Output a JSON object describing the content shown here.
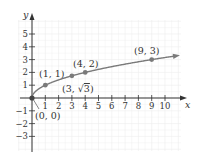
{
  "chart_data": {
    "type": "line",
    "title": "",
    "function": "y = sqrt(x)",
    "xlabel": "x",
    "ylabel": "y",
    "xlim": [
      -0.5,
      11.5
    ],
    "ylim": [
      -4,
      6.3
    ],
    "grid": true,
    "x_ticks": [
      1,
      2,
      3,
      4,
      5,
      6,
      7,
      8,
      9,
      10
    ],
    "y_ticks": [
      -3,
      -2,
      -1,
      1,
      2,
      3,
      4,
      5
    ],
    "x_tick_labels": [
      "1",
      "2",
      "3",
      "4",
      "5",
      "6",
      "7",
      "8",
      "9",
      "10"
    ],
    "y_tick_labels": [
      "−3",
      "−2",
      "−1",
      "1",
      "2",
      "3",
      "4",
      "5"
    ],
    "series": [
      {
        "name": "sqrt(x)",
        "x": [
          0,
          1,
          3,
          4,
          9,
          11
        ],
        "y": [
          0,
          1,
          1.732,
          2,
          3,
          3.317
        ],
        "end_arrow": true
      }
    ],
    "points": [
      {
        "x": 0,
        "y": 0,
        "label": "(0, 0)"
      },
      {
        "x": 1,
        "y": 1,
        "label": "(1, 1)"
      },
      {
        "x": 3,
        "y": 1.732,
        "label": "(3, √3)"
      },
      {
        "x": 4,
        "y": 2,
        "label": "(4, 2)"
      },
      {
        "x": 9,
        "y": 3,
        "label": "(9, 3)"
      }
    ]
  },
  "colors": {
    "axis": "#333333",
    "curve": "#7a7a7a",
    "point": "#7a7a7a",
    "grid": "#ececec",
    "text": "#333333"
  },
  "labels": {
    "x_axis": "x",
    "y_axis": "y",
    "p0": "(0, 0)",
    "p1": "(1, 1)",
    "p3_prefix": "(3, ",
    "p3_sqrt": "√",
    "p3_radicand": "3",
    "p3_suffix": ")",
    "p4": "(4, 2)",
    "p9": "(9, 3)"
  }
}
